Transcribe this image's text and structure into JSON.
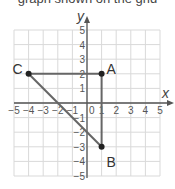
{
  "cropped_text_top": "graph shown on the grid",
  "chart_data": {
    "type": "scatter",
    "title": "",
    "xlabel": "x",
    "ylabel": "y",
    "xlim": [
      -5,
      5
    ],
    "ylim": [
      -5,
      5
    ],
    "grid": true,
    "x_ticks": [
      "−5",
      "−4",
      "−3",
      "−2",
      "−1",
      "0",
      "1",
      "2",
      "3",
      "4",
      "5"
    ],
    "y_ticks": [
      "5",
      "4",
      "3",
      "2",
      "1",
      "−1",
      "−2",
      "−3",
      "−4",
      "−5"
    ],
    "points": [
      {
        "label": "A",
        "x": 1,
        "y": 2
      },
      {
        "label": "B",
        "x": 1,
        "y": -3
      },
      {
        "label": "C",
        "x": -4,
        "y": 2
      }
    ],
    "segments": [
      [
        "C",
        "A"
      ],
      [
        "A",
        "B"
      ],
      [
        "B",
        "C"
      ]
    ],
    "colors": {
      "grid": "#d9d9d9",
      "axis": "#555555",
      "segment": "#666666",
      "point": "#222222"
    }
  },
  "labels": {
    "x_axis": "x",
    "y_axis": "y",
    "A": "A",
    "B": "B",
    "C": "C",
    "origin": "0"
  }
}
